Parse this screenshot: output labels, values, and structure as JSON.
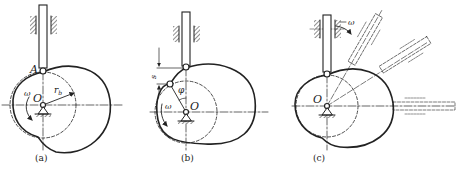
{
  "figure": {
    "colors": {
      "ink": "#222222",
      "background": "#ffffff"
    },
    "panels": [
      {
        "id": "a",
        "caption": "(a)",
        "labels": {
          "contact_point": "A",
          "center": "O",
          "angular_velocity": "ω",
          "base_radius": "r",
          "base_radius_sub": "b"
        }
      },
      {
        "id": "b",
        "caption": "(b)",
        "labels": {
          "center": "O",
          "angular_velocity": "ω",
          "angle": "φ",
          "displacement": "s"
        }
      },
      {
        "id": "c",
        "caption": "(c)",
        "labels": {
          "center": "O",
          "angular_velocity": "−ω"
        }
      }
    ]
  }
}
